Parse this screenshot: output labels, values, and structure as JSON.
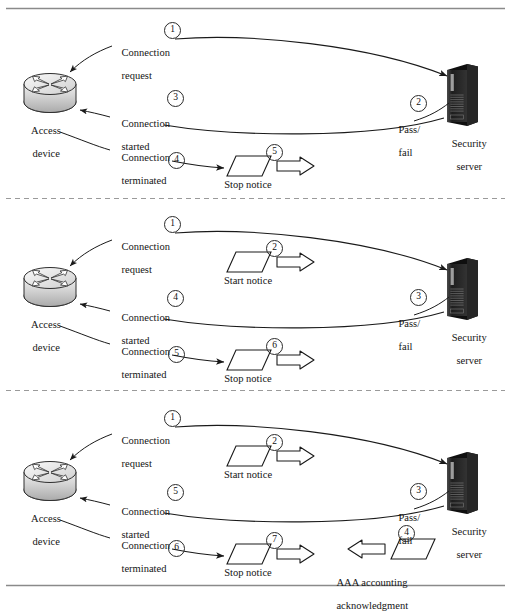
{
  "figure": {
    "type": "network-sequence-diagram",
    "title_visible": false,
    "frame": {
      "top_rule": "solid",
      "bottom_rule": "solid",
      "panel_separator": "dashed"
    },
    "nodes": {
      "access_device": {
        "label_line1": "Access",
        "label_line2": "device",
        "icon": "router-icon"
      },
      "security_server": {
        "label_line1": "Security",
        "label_line2": "server",
        "icon": "server-tower-icon"
      }
    },
    "common_labels": {
      "connection_request_l1": "Connection",
      "connection_request_l2": "request",
      "connection_started_l1": "Connection",
      "connection_started_l2": "started",
      "connection_terminated_l1": "Connection",
      "connection_terminated_l2": "terminated",
      "pass_fail_l1": "Pass/",
      "pass_fail_l2": "fail",
      "stop_notice": "Stop notice",
      "start_notice": "Start notice",
      "aaa_ack_l1": "AAA accounting",
      "aaa_ack_l2": "acknowledgment"
    },
    "panels": [
      {
        "id": "panel-authentication",
        "steps": [
          {
            "n": "1",
            "label": "Connection request"
          },
          {
            "n": "2",
            "label": "Pass/fail"
          },
          {
            "n": "3",
            "label": "Connection started"
          },
          {
            "n": "4",
            "label": "Connection terminated"
          },
          {
            "n": "5",
            "label": "Stop notice"
          }
        ]
      },
      {
        "id": "panel-authentication-accounting",
        "steps": [
          {
            "n": "1",
            "label": "Connection request"
          },
          {
            "n": "2",
            "label": "Start notice"
          },
          {
            "n": "3",
            "label": "Pass/fail"
          },
          {
            "n": "4",
            "label": "Connection started"
          },
          {
            "n": "5",
            "label": "Connection terminated"
          },
          {
            "n": "6",
            "label": "Stop notice"
          }
        ]
      },
      {
        "id": "panel-accounting-with-ack",
        "steps": [
          {
            "n": "1",
            "label": "Connection request"
          },
          {
            "n": "2",
            "label": "Start notice"
          },
          {
            "n": "3",
            "label": "Pass/fail"
          },
          {
            "n": "4",
            "label": "AAA accounting acknowledgment"
          },
          {
            "n": "5",
            "label": "Connection started"
          },
          {
            "n": "6",
            "label": "Connection terminated"
          },
          {
            "n": "7",
            "label": "Stop notice"
          }
        ]
      }
    ],
    "colors": {
      "ink": "#141414",
      "rule": "#8a8a8a",
      "server_body": "#2b2b2b",
      "server_side": "#0d0d0d",
      "router_body": "#d8d8d8",
      "background": "#ffffff"
    }
  }
}
